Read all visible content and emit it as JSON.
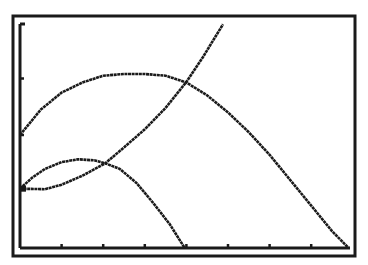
{
  "screen": {
    "background": "#ffffff",
    "ink": "#1a1a1a"
  },
  "chart_data": {
    "type": "line",
    "title": "",
    "xlabel": "",
    "ylabel": "",
    "xlim": [
      0,
      7.9
    ],
    "ylim": [
      0,
      4.1
    ],
    "grid": false,
    "legend": "none",
    "x_ticks": [
      1,
      2,
      3,
      4,
      5,
      6,
      7
    ],
    "y_ticks": [
      1,
      2,
      4
    ],
    "series": [
      {
        "name": "parabola-large",
        "points": [
          [
            0,
            2.0
          ],
          [
            0.5,
            2.45
          ],
          [
            1.0,
            2.75
          ],
          [
            1.5,
            2.93
          ],
          [
            2.0,
            3.05
          ],
          [
            2.5,
            3.08
          ],
          [
            3.0,
            3.08
          ],
          [
            3.5,
            3.05
          ],
          [
            4.0,
            2.93
          ],
          [
            4.5,
            2.7
          ],
          [
            5.0,
            2.4
          ],
          [
            5.5,
            2.05
          ],
          [
            6.0,
            1.65
          ],
          [
            6.5,
            1.2
          ],
          [
            7.0,
            0.75
          ],
          [
            7.5,
            0.3
          ],
          [
            7.9,
            0.0
          ]
        ]
      },
      {
        "name": "parabola-small",
        "points": [
          [
            0,
            1.05
          ],
          [
            0.3,
            1.25
          ],
          [
            0.6,
            1.4
          ],
          [
            1.0,
            1.52
          ],
          [
            1.4,
            1.57
          ],
          [
            1.8,
            1.55
          ],
          [
            2.05,
            1.5
          ],
          [
            2.4,
            1.4
          ],
          [
            2.8,
            1.15
          ],
          [
            3.2,
            0.8
          ],
          [
            3.6,
            0.42
          ],
          [
            3.96,
            0.0
          ]
        ]
      },
      {
        "name": "rising-curve",
        "points": [
          [
            0,
            1.05
          ],
          [
            0.6,
            1.04
          ],
          [
            1.0,
            1.12
          ],
          [
            1.5,
            1.28
          ],
          [
            2.05,
            1.5
          ],
          [
            2.5,
            1.78
          ],
          [
            3.0,
            2.1
          ],
          [
            3.5,
            2.48
          ],
          [
            4.0,
            2.94
          ],
          [
            4.4,
            3.38
          ],
          [
            4.88,
            3.96
          ]
        ]
      }
    ]
  }
}
